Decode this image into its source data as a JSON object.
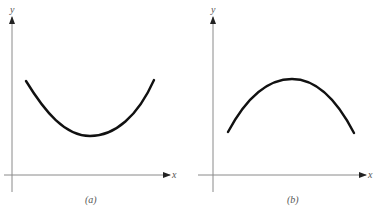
{
  "panels": [
    {
      "id": "a",
      "caption": "(a)",
      "x_axis_label": "x",
      "y_axis_label": "y",
      "curve": "concave-up parabola (minimum)",
      "description": "U-shaped curve with a minimum point"
    },
    {
      "id": "b",
      "caption": "(b)",
      "x_axis_label": "x",
      "y_axis_label": "y",
      "curve": "concave-down parabola (maximum)",
      "description": "Inverted U-shaped curve with a maximum point"
    }
  ],
  "colors": {
    "axis": "#8a8a8a",
    "curve": "#111111",
    "label": "#555555",
    "background": "#ffffff"
  }
}
